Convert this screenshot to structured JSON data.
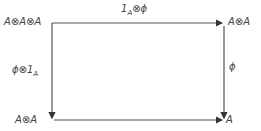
{
  "diagram": {
    "type": "commutative-square",
    "nodes": {
      "top_left": "A⊗A⊗A",
      "top_right": "A⊗A",
      "bottom_left": "A⊗A",
      "bottom_right": "A"
    },
    "arrows": {
      "top": {
        "from": "top_left",
        "to": "top_right",
        "label": "1_A ⊗ ϕ",
        "label_main": "1",
        "label_sub": "A",
        "label_rest": "⊗ϕ"
      },
      "left": {
        "from": "top_left",
        "to": "bottom_left",
        "label": "ϕ ⊗ 1_A",
        "label_main": "ϕ⊗1",
        "label_sub": "A"
      },
      "right": {
        "from": "top_right",
        "to": "bottom_right",
        "label": "ϕ"
      },
      "bottom": {
        "from": "bottom_left",
        "to": "bottom_right",
        "label": ""
      }
    },
    "colors": {
      "line": "#555555",
      "text": "#444444",
      "background": "#ffffff"
    }
  }
}
